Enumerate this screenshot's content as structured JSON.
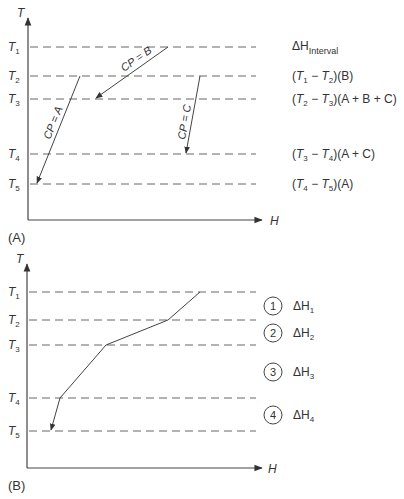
{
  "panel_a": {
    "caption": "(A)",
    "y_axis_label": "T",
    "x_axis_label": "H",
    "levels": [
      {
        "name": "T",
        "sub": "1",
        "y": 47
      },
      {
        "name": "T",
        "sub": "2",
        "y": 76
      },
      {
        "name": "T",
        "sub": "3",
        "y": 99
      },
      {
        "name": "T",
        "sub": "4",
        "y": 154
      },
      {
        "name": "T",
        "sub": "5",
        "y": 184
      }
    ],
    "streams": [
      {
        "label": "CP = B",
        "from": [
          168,
          47
        ],
        "to": [
          95,
          99
        ]
      },
      {
        "label": "CP = A",
        "from": [
          80,
          76
        ],
        "to": [
          36,
          184
        ]
      },
      {
        "label": "CP = C",
        "from": [
          200,
          76
        ],
        "to": [
          185,
          154
        ]
      }
    ],
    "header": {
      "prefix": "ΔH",
      "sub": "Interval"
    },
    "intervals": [
      {
        "t_hi": "1",
        "t_lo": "2",
        "streams": "(B)"
      },
      {
        "t_hi": "2",
        "t_lo": "3",
        "streams": "(A + B + C)"
      },
      {
        "t_hi": "3",
        "t_lo": "4",
        "streams": "(A + C)"
      },
      {
        "t_hi": "4",
        "t_lo": "5",
        "streams": "(A)"
      }
    ]
  },
  "panel_b": {
    "caption": "(B)",
    "y_axis_label": "T",
    "x_axis_label": "H",
    "levels": [
      {
        "name": "T",
        "sub": "1",
        "y": 292
      },
      {
        "name": "T",
        "sub": "2",
        "y": 320
      },
      {
        "name": "T",
        "sub": "3",
        "y": 345
      },
      {
        "name": "T",
        "sub": "4",
        "y": 398
      },
      {
        "name": "T",
        "sub": "5",
        "y": 431
      }
    ],
    "composite_curve": [
      [
        200,
        292
      ],
      [
        168,
        320
      ],
      [
        106,
        345
      ],
      [
        60,
        398
      ],
      [
        50,
        431
      ]
    ],
    "intervals": [
      {
        "number": "1",
        "label": "ΔH",
        "sub": "1"
      },
      {
        "number": "2",
        "label": "ΔH",
        "sub": "2"
      },
      {
        "number": "3",
        "label": "ΔH",
        "sub": "3"
      },
      {
        "number": "4",
        "label": "ΔH",
        "sub": "4"
      }
    ]
  }
}
